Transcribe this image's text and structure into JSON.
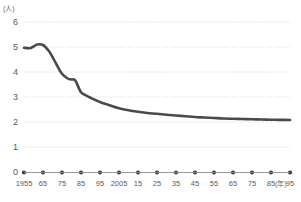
{
  "chart_data": {
    "type": "line",
    "title": "",
    "subtitle": "",
    "xlabel": "(年)",
    "ylabel": "(人)",
    "y_unit_label": "(人)",
    "x_unit_label": "(年)",
    "grid": true,
    "legend": null,
    "legend_position": "none",
    "xlim": [
      1955,
      2095
    ],
    "ylim": [
      0,
      6
    ],
    "yticks": [
      "0",
      "1",
      "2",
      "3",
      "4",
      "5",
      "6"
    ],
    "ytick_values": [
      0,
      1,
      2,
      3,
      4,
      5,
      6
    ],
    "categories": [
      "1955",
      "65",
      "75",
      "85",
      "95",
      "2005",
      "15",
      "25",
      "35",
      "45",
      "55",
      "65",
      "75",
      "85",
      "95"
    ],
    "x": [
      1955,
      1965,
      1975,
      1985,
      1995,
      2005,
      2015,
      2025,
      2035,
      2045,
      2055,
      2065,
      2075,
      2085,
      2095
    ],
    "series": [
      {
        "name": "平均世帯人員",
        "color": "#4a4a4a",
        "values": [
          4.97,
          5.08,
          3.93,
          3.19,
          2.8,
          2.55,
          2.41,
          2.33,
          2.26,
          2.2,
          2.16,
          2.13,
          2.11,
          2.09,
          2.08
        ],
        "points_dense": [
          [
            1955,
            4.97
          ],
          [
            1958,
            4.95
          ],
          [
            1960,
            5.02
          ],
          [
            1962,
            5.1
          ],
          [
            1965,
            5.08
          ],
          [
            1968,
            4.85
          ],
          [
            1970,
            4.6
          ],
          [
            1972,
            4.32
          ],
          [
            1975,
            3.93
          ],
          [
            1978,
            3.74
          ],
          [
            1980,
            3.7
          ],
          [
            1982,
            3.66
          ],
          [
            1985,
            3.19
          ],
          [
            1988,
            3.05
          ],
          [
            1990,
            2.97
          ],
          [
            1995,
            2.8
          ],
          [
            2000,
            2.67
          ],
          [
            2005,
            2.55
          ],
          [
            2010,
            2.47
          ],
          [
            2015,
            2.41
          ],
          [
            2020,
            2.36
          ],
          [
            2025,
            2.33
          ],
          [
            2030,
            2.29
          ],
          [
            2035,
            2.26
          ],
          [
            2040,
            2.23
          ],
          [
            2045,
            2.2
          ],
          [
            2050,
            2.18
          ],
          [
            2055,
            2.16
          ],
          [
            2060,
            2.14
          ],
          [
            2065,
            2.13
          ],
          [
            2070,
            2.12
          ],
          [
            2075,
            2.11
          ],
          [
            2080,
            2.1
          ],
          [
            2085,
            2.09
          ],
          [
            2090,
            2.085
          ],
          [
            2095,
            2.08
          ]
        ]
      }
    ]
  },
  "colors": {
    "line": "#4a4a4a",
    "grid": "#c9c9c9",
    "axis": "#8a8a8a",
    "tick_dot": "#3a3a3a",
    "text": "#5a5a5a"
  }
}
